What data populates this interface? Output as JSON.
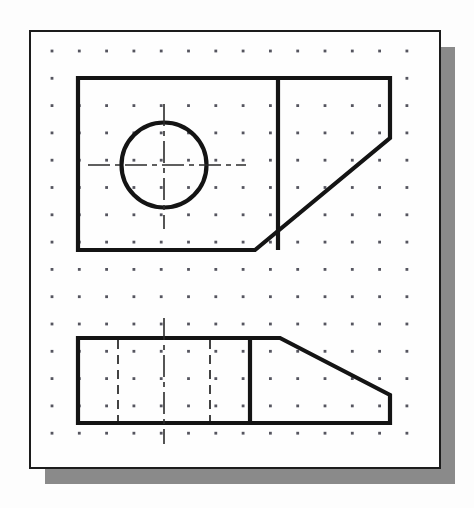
{
  "document": {
    "kind": "engineering-drawing",
    "title": "Orthographic sketch on dot grid paper",
    "description": "Two-view multiview sketch of an angled block with a through hole, drawn on isometric-style dot grid sheet with drop shadow.",
    "views_count": "2",
    "labels": {
      "top_view": "Top view",
      "front_view": "Front view"
    }
  },
  "colors": {
    "page_background": "#fdfdfd",
    "sheet_fill": "#fefefe",
    "sheet_border": "#1c1c1c",
    "shadow": "#8a8a8a",
    "object_line": "#141414",
    "hidden_line": "#3a3a3a",
    "center_line": "#2b2b2b",
    "grid_dot": "#55555f"
  },
  "sheet": {
    "x": 30,
    "y": 31,
    "width": 410,
    "height": 437,
    "border_width": 2,
    "shadow_offset_x": 15,
    "shadow_offset_y": 16
  },
  "grid": {
    "origin_x": 52,
    "origin_y": 51,
    "spacing_x": 27.3,
    "spacing_y": 27.3,
    "columns": 14,
    "rows": 15,
    "dot_radius": 1.4
  },
  "line_weights": {
    "object": 4.2,
    "hidden": 1.9,
    "center": 1.6
  },
  "views": [
    {
      "name": "top-view",
      "label": "Top view",
      "outline": "78,78 390,78 390,138 255,250 78,250",
      "interior_lines": [
        {
          "name": "vertical-edge-line",
          "x1": 278,
          "y1": 78,
          "x2": 278,
          "y2": 250
        }
      ],
      "circle": {
        "name": "through-hole",
        "cx": 164,
        "cy": 165,
        "r": 42.5,
        "diameter_px": "85"
      },
      "center_lines": [
        {
          "name": "horizontal-center-line",
          "x1": 88,
          "y1": 165,
          "x2": 246,
          "y2": 165
        },
        {
          "name": "vertical-center-line",
          "x1": 164,
          "y1": 104,
          "x2": 164,
          "y2": 229
        }
      ]
    },
    {
      "name": "front-view",
      "label": "Front view",
      "outline": "78,338 280,338 390,395 390,423 78,423",
      "interior_lines": [
        {
          "name": "vertical-edge-line",
          "x1": 250,
          "y1": 338,
          "x2": 250,
          "y2": 423
        }
      ],
      "hidden_lines": [
        {
          "name": "hidden-hole-edge-left",
          "x1": 118,
          "y1": 340,
          "x2": 118,
          "y2": 421
        },
        {
          "name": "hidden-hole-edge-right",
          "x1": 210,
          "y1": 340,
          "x2": 210,
          "y2": 421
        }
      ],
      "center_lines": [
        {
          "name": "vertical-center-line",
          "x1": 164,
          "y1": 318,
          "x2": 164,
          "y2": 444
        }
      ]
    }
  ],
  "dash_patterns": {
    "hidden": "9 6",
    "center_long": "22 5 5 5"
  }
}
